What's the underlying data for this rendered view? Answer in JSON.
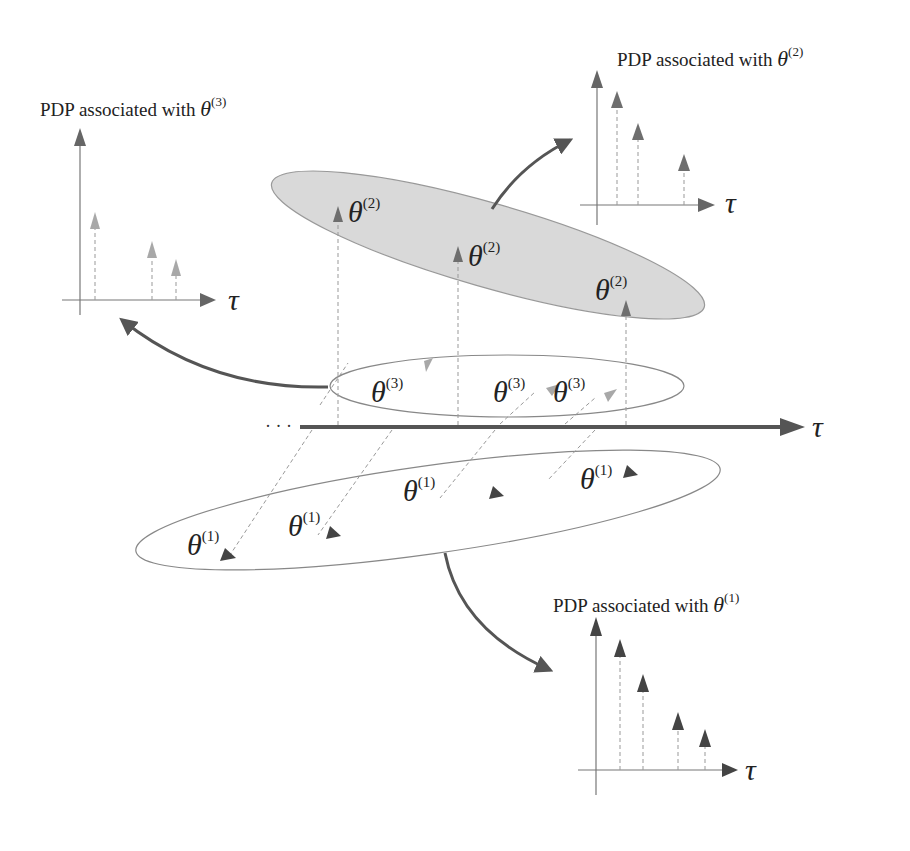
{
  "labels": {
    "pdp3_title": "PDP associated with ",
    "pdp2_title": "PDP associated with ",
    "pdp1_title": "PDP associated with ",
    "theta": "θ",
    "sup1": "(1)",
    "sup2": "(2)",
    "sup3": "(3)",
    "tau": "τ",
    "ellipsis": "· · ·"
  },
  "colors": {
    "cluster2_fill": "#d9d9d9",
    "cluster1_arrow": "#444444",
    "cluster2_arrow": "#6e6e6e",
    "cluster3_arrow": "#a8a8a8",
    "axis_main": "#555555"
  },
  "pdp_plots": [
    {
      "cluster": "theta(3)",
      "relative_heights": [
        0.55,
        0.33,
        0.25
      ]
    },
    {
      "cluster": "theta(2)",
      "relative_heights": [
        0.85,
        0.6,
        0.35
      ]
    },
    {
      "cluster": "theta(1)",
      "relative_heights": [
        0.88,
        0.68,
        0.42,
        0.33
      ]
    }
  ]
}
